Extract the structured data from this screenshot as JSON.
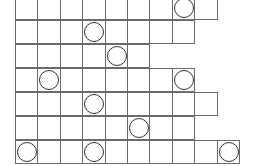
{
  "grid": {
    "cell_size_px": 24,
    "line_color": "#6a6a6a",
    "circle_color": "#333333",
    "rows": [
      {
        "cols": 9,
        "circles": [
          7
        ]
      },
      {
        "cols": 8,
        "circles": [
          3
        ]
      },
      {
        "cols": 6,
        "circles": [
          4
        ]
      },
      {
        "cols": 8,
        "circles": [
          1,
          7
        ]
      },
      {
        "cols": 9,
        "circles": [
          3
        ]
      },
      {
        "cols": 8,
        "circles": [
          5
        ]
      },
      {
        "cols": 10,
        "circles": [
          0,
          3,
          9
        ]
      }
    ]
  }
}
